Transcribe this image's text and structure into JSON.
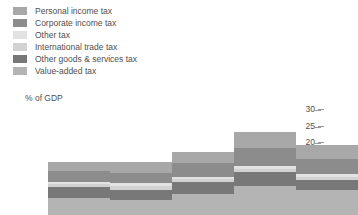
{
  "legend": {
    "items": [
      {
        "label": "Personal income tax",
        "color": "#a8a8a8"
      },
      {
        "label": "Corporate income tax",
        "color": "#8c8c8c"
      },
      {
        "label": "Other tax",
        "color": "#e2e2e2"
      },
      {
        "label": "International trade tax",
        "color": "#d2d2d2"
      },
      {
        "label": "Other goods & services tax",
        "color": "#787878"
      },
      {
        "label": "Value-added tax",
        "color": "#b4b4b4"
      }
    ]
  },
  "chart_data": {
    "type": "bar",
    "title": "",
    "subtitle": "",
    "xlabel": "",
    "ylabel": "% of GDP",
    "ylim": [
      0,
      30
    ],
    "yticks": [
      0,
      5,
      10,
      15,
      20,
      25,
      30
    ],
    "grid": false,
    "stacked": true,
    "legend_position": "top-left",
    "categories": [
      "",
      "",
      "",
      "",
      ""
    ],
    "series": [
      {
        "name": "Value-added tax",
        "color": "#b4b4b4",
        "values": [
          5.0,
          4.6,
          6.2,
          8.6,
          7.4
        ]
      },
      {
        "name": "Other goods & services tax",
        "color": "#787878",
        "values": [
          3.4,
          3.0,
          3.6,
          4.4,
          3.2
        ]
      },
      {
        "name": "International trade tax",
        "color": "#d2d2d2",
        "values": [
          0.8,
          1.0,
          0.9,
          0.8,
          0.8
        ]
      },
      {
        "name": "Other tax",
        "color": "#e2e2e2",
        "values": [
          0.7,
          0.9,
          0.8,
          1.0,
          0.9
        ]
      },
      {
        "name": "Corporate income tax",
        "color": "#8c8c8c",
        "values": [
          3.4,
          3.2,
          4.0,
          5.2,
          4.6
        ]
      },
      {
        "name": "Personal income tax",
        "color": "#a8a8a8",
        "values": [
          2.7,
          3.3,
          3.5,
          5.0,
          4.1
        ]
      }
    ],
    "totals": [
      16.0,
      16.0,
      19.0,
      25.0,
      21.0
    ]
  }
}
